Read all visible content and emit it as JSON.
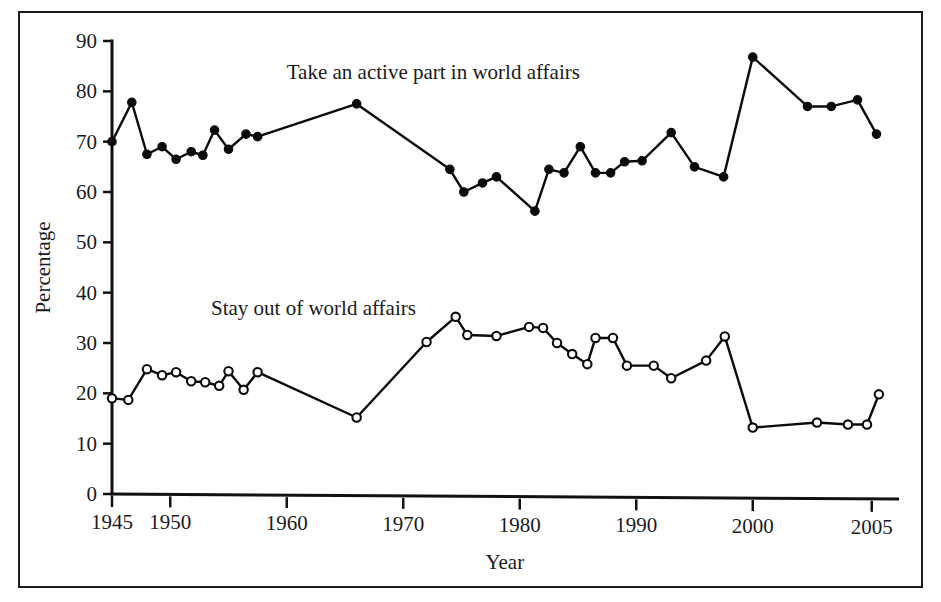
{
  "figure": {
    "border_color": "#1a1a1a",
    "background": "#ffffff",
    "ink_color": "#0b0b0b"
  },
  "chart_data": {
    "type": "line",
    "title": "",
    "subtitle": "",
    "xlabel": "Year",
    "ylabel": "Percentage",
    "xlim": [
      1945,
      2006
    ],
    "ylim": [
      0,
      90
    ],
    "grid": false,
    "legend_position": "inline-annotation",
    "x_ticks": [
      1945,
      1950,
      1960,
      1970,
      1980,
      1990,
      2000,
      2005
    ],
    "x_tick_labels": [
      "1945",
      "1950",
      "1960",
      "1970",
      "1980",
      "1990",
      "2000",
      "2005"
    ],
    "y_ticks": [
      0,
      10,
      20,
      30,
      40,
      50,
      60,
      70,
      80,
      90
    ],
    "y_tick_labels": [
      "0",
      "10",
      "20",
      "30",
      "40",
      "50",
      "60",
      "70",
      "80",
      "90"
    ],
    "annotations": [
      {
        "text": "Take an active part in world affairs",
        "x": 1960.0,
        "y": 82.5,
        "anchor": "start"
      },
      {
        "text": "Stay out of world affairs",
        "x": 1953.5,
        "y": 35.5,
        "anchor": "start"
      }
    ],
    "series": [
      {
        "name": "Take an active part in world affairs",
        "marker": "filled-circle",
        "marker_radius": 4.2,
        "points": [
          {
            "x": 1945.0,
            "y": 70.0
          },
          {
            "x": 1946.7,
            "y": 77.8
          },
          {
            "x": 1948.0,
            "y": 67.5
          },
          {
            "x": 1949.3,
            "y": 69.0
          },
          {
            "x": 1950.5,
            "y": 66.5
          },
          {
            "x": 1951.8,
            "y": 68.0
          },
          {
            "x": 1952.8,
            "y": 67.3
          },
          {
            "x": 1953.8,
            "y": 72.3
          },
          {
            "x": 1955.0,
            "y": 68.5
          },
          {
            "x": 1956.5,
            "y": 71.5
          },
          {
            "x": 1957.5,
            "y": 71.0
          },
          {
            "x": 1966.0,
            "y": 77.5
          },
          {
            "x": 1974.0,
            "y": 64.5
          },
          {
            "x": 1975.2,
            "y": 60.0
          },
          {
            "x": 1976.8,
            "y": 61.8
          },
          {
            "x": 1978.0,
            "y": 63.0
          },
          {
            "x": 1981.3,
            "y": 56.2
          },
          {
            "x": 1982.5,
            "y": 64.5
          },
          {
            "x": 1983.8,
            "y": 63.8
          },
          {
            "x": 1985.2,
            "y": 69.0
          },
          {
            "x": 1986.5,
            "y": 63.8
          },
          {
            "x": 1987.8,
            "y": 63.8
          },
          {
            "x": 1989.0,
            "y": 66.0
          },
          {
            "x": 1990.5,
            "y": 66.2
          },
          {
            "x": 1993.0,
            "y": 71.8
          },
          {
            "x": 1995.0,
            "y": 65.0
          },
          {
            "x": 1997.5,
            "y": 63.0
          },
          {
            "x": 2000.0,
            "y": 86.8
          },
          {
            "x": 2002.3,
            "y": 77.0
          },
          {
            "x": 2003.3,
            "y": 77.0
          },
          {
            "x": 2004.4,
            "y": 78.3
          },
          {
            "x": 2005.2,
            "y": 71.5
          }
        ]
      },
      {
        "name": "Stay out of world affairs",
        "marker": "open-circle",
        "marker_radius": 4.2,
        "points": [
          {
            "x": 1945.0,
            "y": 19.0
          },
          {
            "x": 1946.4,
            "y": 18.7
          },
          {
            "x": 1948.0,
            "y": 24.8
          },
          {
            "x": 1949.3,
            "y": 23.6
          },
          {
            "x": 1950.5,
            "y": 24.2
          },
          {
            "x": 1951.8,
            "y": 22.4
          },
          {
            "x": 1953.0,
            "y": 22.2
          },
          {
            "x": 1954.2,
            "y": 21.5
          },
          {
            "x": 1955.0,
            "y": 24.4
          },
          {
            "x": 1956.3,
            "y": 20.7
          },
          {
            "x": 1957.5,
            "y": 24.2
          },
          {
            "x": 1966.0,
            "y": 15.2
          },
          {
            "x": 1972.0,
            "y": 30.2
          },
          {
            "x": 1974.5,
            "y": 35.2
          },
          {
            "x": 1975.5,
            "y": 31.6
          },
          {
            "x": 1978.0,
            "y": 31.4
          },
          {
            "x": 1980.8,
            "y": 33.2
          },
          {
            "x": 1982.0,
            "y": 33.0
          },
          {
            "x": 1983.2,
            "y": 30.0
          },
          {
            "x": 1984.5,
            "y": 27.8
          },
          {
            "x": 1985.8,
            "y": 25.8
          },
          {
            "x": 1986.5,
            "y": 31.0
          },
          {
            "x": 1988.0,
            "y": 31.0
          },
          {
            "x": 1989.2,
            "y": 25.5
          },
          {
            "x": 1991.5,
            "y": 25.5
          },
          {
            "x": 1993.0,
            "y": 23.0
          },
          {
            "x": 1996.0,
            "y": 26.5
          },
          {
            "x": 1997.6,
            "y": 31.3
          },
          {
            "x": 2000.0,
            "y": 13.2
          },
          {
            "x": 2002.7,
            "y": 14.2
          },
          {
            "x": 2004.0,
            "y": 13.8
          },
          {
            "x": 2004.8,
            "y": 13.8
          },
          {
            "x": 2005.3,
            "y": 19.8
          }
        ]
      }
    ]
  }
}
